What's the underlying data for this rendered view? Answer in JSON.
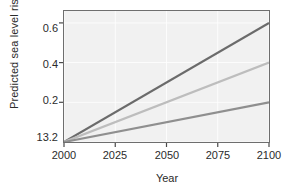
{
  "chart_data": {
    "type": "line",
    "title": "",
    "xlabel": "Year",
    "ylabel": "Predicted sea level rise (m)",
    "xlim": [
      2000,
      2100
    ],
    "ylim": [
      0.0,
      0.66
    ],
    "xticks": [
      2000,
      2025,
      2050,
      2075,
      2100
    ],
    "xtick_labels": [
      "2000",
      "2025",
      "2050",
      "2075",
      "2100"
    ],
    "yticks": [
      0.0,
      0.2,
      0.4,
      0.6
    ],
    "ytick_labels": [
      "13.2",
      "0.2",
      "0.4",
      "0.6"
    ],
    "grid": true,
    "legend": "none",
    "x": [
      2000,
      2100
    ],
    "series": [
      {
        "name": "high-scenario",
        "color": "#6b6b6b",
        "values": [
          0.0,
          0.6
        ]
      },
      {
        "name": "mid-scenario",
        "color": "#bdbdbd",
        "values": [
          0.0,
          0.4
        ]
      },
      {
        "name": "low-scenario",
        "color": "#8f8f8f",
        "values": [
          0.0,
          0.2
        ]
      }
    ]
  }
}
